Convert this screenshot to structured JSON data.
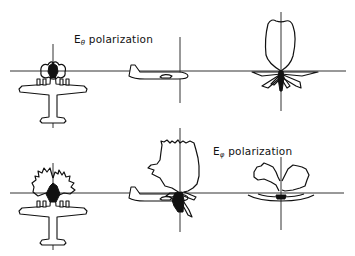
{
  "figure": {
    "type": "radiation pattern diagram",
    "rows": [
      {
        "label_main": "E",
        "label_sub": "θ",
        "label_rest": " polarization",
        "polarization": "E-theta",
        "views": [
          "top-view aircraft",
          "side-view aircraft",
          "front pattern"
        ]
      },
      {
        "label_main": "E",
        "label_sub": "φ",
        "label_rest": " polarization",
        "polarization": "E-phi",
        "views": [
          "top-view aircraft",
          "side-view aircraft",
          "front pattern"
        ]
      }
    ],
    "colors": {
      "ink": "#111111",
      "axis": "#333333",
      "background": "#ffffff"
    }
  }
}
